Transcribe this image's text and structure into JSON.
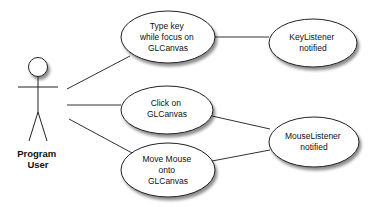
{
  "diagram": {
    "type": "use-case",
    "actor": {
      "label_lines": [
        "Program",
        "User"
      ]
    },
    "use_cases": [
      {
        "id": "type_key",
        "label_lines": [
          "Type key",
          "while focus on",
          "GLCanvas"
        ]
      },
      {
        "id": "click",
        "label_lines": [
          "Click on",
          "GLCanvas"
        ]
      },
      {
        "id": "move_mouse",
        "label_lines": [
          "Move Mouse",
          "onto",
          "GLCanvas"
        ]
      }
    ],
    "outcomes": [
      {
        "id": "key_listener",
        "label_lines": [
          "KeyListener",
          "notified"
        ]
      },
      {
        "id": "mouse_listener",
        "label_lines": [
          "MouseListener",
          "notified"
        ]
      }
    ],
    "associations": [
      {
        "from": "actor",
        "to": "type_key"
      },
      {
        "from": "actor",
        "to": "click"
      },
      {
        "from": "actor",
        "to": "move_mouse"
      },
      {
        "from": "type_key",
        "to": "key_listener"
      },
      {
        "from": "click",
        "to": "mouse_listener"
      },
      {
        "from": "move_mouse",
        "to": "mouse_listener"
      }
    ]
  }
}
